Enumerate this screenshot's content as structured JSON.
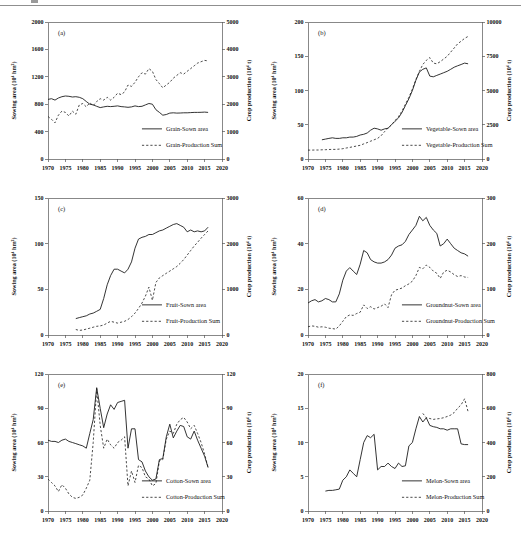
{
  "figure": {
    "panel_letters": [
      "(a)",
      "(b)",
      "(c)",
      "(d)",
      "(e)",
      "(f)"
    ]
  },
  "chart_data": [
    {
      "type": "line",
      "panel_label": "(a)",
      "crop": "Grain",
      "x": {
        "range": [
          1970,
          2020
        ],
        "ticks": [
          1970,
          1975,
          1980,
          1985,
          1990,
          1995,
          2000,
          2005,
          2010,
          2015,
          2020
        ]
      },
      "left_axis": {
        "label": "Sowing area (10⁴ hm²)",
        "range": [
          0,
          2000
        ],
        "ticks": [
          0,
          400,
          800,
          1200,
          1600,
          2000
        ]
      },
      "right_axis": {
        "label": "Crop production (10⁴ t)",
        "range": [
          0,
          5000
        ],
        "ticks": [
          0,
          1000,
          2000,
          3000,
          4000,
          5000
        ]
      },
      "legend": {
        "position": "bottom-right",
        "entries": [
          "Grain-Sown area",
          "Grain-Production Sum"
        ]
      },
      "series": [
        {
          "name": "Grain-Sown area",
          "axis": "left",
          "line": "solid",
          "start_year": 1970,
          "values": [
            870,
            880,
            860,
            890,
            910,
            920,
            915,
            905,
            910,
            900,
            880,
            840,
            800,
            790,
            770,
            750,
            760,
            770,
            765,
            770,
            775,
            765,
            760,
            755,
            760,
            775,
            765,
            770,
            790,
            810,
            800,
            720,
            680,
            640,
            650,
            670,
            675,
            670,
            672,
            675,
            675,
            678,
            680,
            680,
            682,
            685,
            680
          ]
        },
        {
          "name": "Grain-Production Sum",
          "axis": "right",
          "line": "dashed",
          "start_year": 1970,
          "values": [
            1550,
            1450,
            1320,
            1600,
            1750,
            1700,
            1570,
            1750,
            1630,
            1975,
            2025,
            1900,
            2050,
            1950,
            2100,
            2200,
            2150,
            2250,
            2150,
            2250,
            2400,
            2350,
            2450,
            2700,
            2650,
            2800,
            3000,
            3150,
            3100,
            3300,
            3200,
            2900,
            2750,
            2600,
            2700,
            2800,
            2950,
            3050,
            3150,
            3100,
            3200,
            3300,
            3400,
            3500,
            3550,
            3600,
            3580
          ]
        }
      ]
    },
    {
      "type": "line",
      "panel_label": "(b)",
      "crop": "Vegetable",
      "x": {
        "range": [
          1970,
          2020
        ],
        "ticks": [
          1970,
          1975,
          1980,
          1985,
          1990,
          1995,
          2000,
          2005,
          2010,
          2015,
          2020
        ]
      },
      "left_axis": {
        "label": "Sowing area (10⁴ hm²)",
        "range": [
          0,
          200
        ],
        "ticks": [
          0,
          50,
          100,
          150,
          200
        ]
      },
      "right_axis": {
        "label": "Crop production (10⁴ t)",
        "range": [
          0,
          10000
        ],
        "ticks": [
          0,
          2500,
          5000,
          7500,
          10000
        ]
      },
      "legend": {
        "position": "bottom-right",
        "entries": [
          "Vegetable-Sown area",
          "Vegetable-Production Sum"
        ]
      },
      "series": [
        {
          "name": "Vegetable-Sown area",
          "axis": "left",
          "line": "solid",
          "start_year": 1974,
          "values": [
            28,
            29,
            30,
            31,
            30,
            30,
            31,
            31,
            32,
            32,
            33,
            35,
            36,
            38,
            42,
            45,
            44,
            42,
            44,
            45,
            50,
            55,
            60,
            68,
            78,
            88,
            100,
            115,
            127,
            131,
            133,
            121,
            120,
            122,
            124,
            126,
            128,
            131,
            134,
            136,
            138,
            140,
            139
          ]
        },
        {
          "name": "Vegetable-Production Sum",
          "axis": "right",
          "line": "dashed",
          "start_year": 1970,
          "values": [
            650,
            650,
            660,
            660,
            670,
            680,
            690,
            700,
            700,
            720,
            750,
            800,
            850,
            900,
            950,
            1000,
            1100,
            1200,
            1300,
            1400,
            1500,
            1700,
            2000,
            2250,
            2500,
            2800,
            3100,
            3500,
            4000,
            4500,
            5100,
            5800,
            6400,
            6900,
            7200,
            7400,
            7000,
            6950,
            7100,
            7300,
            7500,
            7800,
            8100,
            8400,
            8600,
            8800,
            8950
          ]
        }
      ]
    },
    {
      "type": "line",
      "panel_label": "(c)",
      "crop": "Fruit",
      "x": {
        "range": [
          1970,
          2020
        ],
        "ticks": [
          1970,
          1975,
          1980,
          1985,
          1990,
          1995,
          2000,
          2005,
          2010,
          2015,
          2020
        ]
      },
      "left_axis": {
        "label": "Sowing area (10⁴ hm²)",
        "range": [
          0,
          150
        ],
        "ticks": [
          0,
          50,
          100,
          150
        ]
      },
      "right_axis": {
        "label": "Crop production (10⁴ t)",
        "range": [
          0,
          3000
        ],
        "ticks": [
          0,
          1000,
          2000,
          3000
        ]
      },
      "legend": {
        "position": "bottom-right",
        "entries": [
          "Fruit-Sown area",
          "Fruit-Production Sum"
        ]
      },
      "series": [
        {
          "name": "Fruit-Sown area",
          "axis": "left",
          "line": "solid",
          "start_year": 1978,
          "values": [
            18,
            19,
            20,
            21,
            23,
            24,
            26,
            28,
            40,
            55,
            65,
            72,
            72,
            70,
            68,
            72,
            80,
            95,
            105,
            107,
            108,
            110,
            110,
            112,
            114,
            115,
            117,
            119,
            121,
            122,
            120,
            118,
            113,
            115,
            113,
            114,
            113,
            114,
            118
          ]
        },
        {
          "name": "Fruit-Production Sum",
          "axis": "right",
          "line": "dashed",
          "start_year": 1978,
          "values": [
            120,
            100,
            110,
            130,
            150,
            170,
            190,
            200,
            220,
            260,
            300,
            280,
            260,
            280,
            300,
            340,
            400,
            480,
            580,
            700,
            850,
            1050,
            760,
            1150,
            1250,
            1300,
            1350,
            1400,
            1450,
            1500,
            1570,
            1650,
            1750,
            1850,
            1950,
            2030,
            2120,
            2200,
            2280
          ]
        }
      ]
    },
    {
      "type": "line",
      "panel_label": "(d)",
      "crop": "Groundnut",
      "x": {
        "range": [
          1970,
          2020
        ],
        "ticks": [
          1970,
          1975,
          1980,
          1985,
          1990,
          1995,
          2000,
          2005,
          2010,
          2015,
          2020
        ]
      },
      "left_axis": {
        "label": "Sowing area (10⁴ hm²)",
        "range": [
          0,
          60
        ],
        "ticks": [
          0,
          20,
          40,
          60
        ]
      },
      "right_axis": {
        "label": "Crop production (10⁴ t)",
        "range": [
          0,
          300
        ],
        "ticks": [
          0,
          100,
          200,
          300
        ]
      },
      "legend": {
        "position": "bottom-right",
        "entries": [
          "Groundnut-Sown area",
          "Groundnut-Production Sum"
        ]
      },
      "series": [
        {
          "name": "Groundnut-Sown area",
          "axis": "left",
          "line": "solid",
          "start_year": 1970,
          "values": [
            14,
            15,
            15.5,
            14.5,
            15,
            16,
            15.5,
            14.5,
            14.5,
            18,
            24,
            28,
            29.5,
            28,
            26.5,
            31,
            37,
            36,
            33,
            32,
            31.5,
            31.5,
            32,
            33,
            35,
            38,
            39,
            39.5,
            41,
            44,
            46,
            48,
            52,
            50,
            51.5,
            48,
            46,
            44.5,
            39,
            40,
            42,
            40,
            38,
            37,
            36,
            35.5,
            34.5
          ]
        },
        {
          "name": "Groundnut-Production Sum",
          "axis": "right",
          "line": "dashed",
          "start_year": 1970,
          "values": [
            18,
            20,
            19,
            17,
            18,
            17,
            15,
            14,
            13,
            20,
            30,
            40,
            44,
            43,
            47,
            50,
            66,
            58,
            62,
            57,
            60,
            63,
            68,
            60,
            88,
            98,
            100,
            103,
            108,
            112,
            118,
            130,
            148,
            145,
            153,
            148,
            140,
            135,
            124,
            138,
            142,
            138,
            132,
            128,
            130,
            127,
            126
          ]
        }
      ]
    },
    {
      "type": "line",
      "panel_label": "(e)",
      "crop": "Cotton",
      "x": {
        "range": [
          1970,
          2020
        ],
        "ticks": [
          1970,
          1975,
          1980,
          1985,
          1990,
          1995,
          2000,
          2005,
          2010,
          2015,
          2020
        ]
      },
      "left_axis": {
        "label": "Sowing area (10⁴ hm²)",
        "range": [
          0,
          120
        ],
        "ticks": [
          0,
          30,
          60,
          90,
          120
        ]
      },
      "right_axis": {
        "label": "Crop production (10⁴ t)",
        "range": [
          0,
          120
        ],
        "ticks": [
          0,
          30,
          60,
          90,
          120
        ]
      },
      "legend": {
        "position": "bottom-right",
        "entries": [
          "Cotton-Sown area",
          "Cotton-Production Sum"
        ]
      },
      "series": [
        {
          "name": "Cotton-Sown area",
          "axis": "left",
          "line": "solid",
          "start_year": 1970,
          "values": [
            62,
            61,
            61,
            60,
            62,
            63,
            61,
            60,
            59,
            58,
            57,
            55,
            68,
            80,
            108,
            90,
            73,
            85,
            93,
            89,
            95,
            96,
            97,
            55,
            72,
            72,
            45,
            43,
            35,
            30,
            27,
            28,
            45,
            46,
            65,
            76,
            64,
            70,
            75,
            74,
            65,
            63,
            70,
            62,
            55,
            48,
            38
          ]
        },
        {
          "name": "Cotton-Production Sum",
          "axis": "right",
          "line": "dashed",
          "start_year": 1970,
          "values": [
            28,
            25,
            22,
            17,
            23,
            20,
            15,
            12,
            11,
            12,
            14,
            20,
            27,
            60,
            107,
            75,
            55,
            63,
            58,
            55,
            60,
            62,
            65,
            22,
            35,
            25,
            40,
            38,
            30,
            28,
            22,
            24,
            44,
            45,
            63,
            70,
            68,
            76,
            80,
            82,
            78,
            72,
            75,
            68,
            60,
            50,
            38
          ]
        }
      ]
    },
    {
      "type": "line",
      "panel_label": "(f)",
      "crop": "Melon",
      "x": {
        "range": [
          1970,
          2020
        ],
        "ticks": [
          1970,
          1975,
          1980,
          1985,
          1990,
          1995,
          2000,
          2005,
          2010,
          2015,
          2020
        ]
      },
      "left_axis": {
        "label": "Sowing area (10⁴ hm²)",
        "range": [
          0,
          20
        ],
        "ticks": [
          0,
          5,
          10,
          15,
          20
        ]
      },
      "right_axis": {
        "label": "Crop production (10⁴ t)",
        "range": [
          0,
          800
        ],
        "ticks": [
          0,
          200,
          400,
          600,
          800
        ]
      },
      "legend": {
        "position": "bottom-right",
        "entries": [
          "Melon-Sown area",
          "Melon-Production Sum"
        ]
      },
      "series": [
        {
          "name": "Melon-Sown area",
          "axis": "left",
          "line": "solid",
          "start_year": 1975,
          "values": [
            2.9,
            3,
            3,
            3.1,
            3.2,
            4.5,
            5,
            6,
            5.5,
            5,
            7.5,
            10,
            11,
            10.7,
            11.2,
            6,
            6.5,
            6.5,
            7,
            6.5,
            6.2,
            7,
            6.5,
            6.6,
            9.5,
            10,
            12,
            13.8,
            13,
            13.6,
            12.5,
            12.3,
            12.2,
            12,
            12,
            11.8,
            12,
            12,
            12,
            9.8,
            9.7,
            9.7
          ]
        },
        {
          "name": "Melon-Production Sum",
          "axis": "right",
          "line": "dashed",
          "start_year": 2003,
          "values": [
            570,
            545,
            540,
            535,
            538,
            540,
            545,
            552,
            560,
            575,
            600,
            620,
            655,
            580
          ]
        }
      ]
    }
  ]
}
